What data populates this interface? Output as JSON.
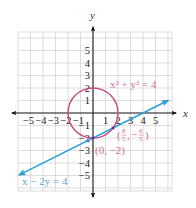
{
  "figure": {
    "axis_labels": {
      "x": "x",
      "y": "y"
    },
    "x_ticks": [
      "−5",
      "−4",
      "−3",
      "−2",
      "−1",
      "1",
      "2",
      "3",
      "4",
      "5"
    ],
    "y_ticks": [
      "5",
      "4",
      "3",
      "2",
      "1",
      "−1",
      "−2",
      "−3",
      "−4",
      "−5"
    ],
    "circle": {
      "equation": "x² + y² = 4",
      "center": [
        0,
        0
      ],
      "radius": 2,
      "color": "#c8507e"
    },
    "line": {
      "equation": "x − 2y = 4",
      "through": [
        [
          0,
          -2
        ],
        [
          4,
          0
        ]
      ],
      "color": "#2a9fd6"
    },
    "intersections": [
      {
        "label_open": "(",
        "num_x": "8",
        "den_x": "5",
        "sep": ",",
        "num_y": "6",
        "den_y": "5",
        "sign_y": "−",
        "label_close": ")",
        "point": [
          1.6,
          -1.2
        ]
      },
      {
        "label": "(0, −2)",
        "point": [
          0,
          -2
        ]
      }
    ],
    "grid": {
      "x_range": [
        -6,
        6
      ],
      "y_range": [
        -6,
        6
      ],
      "spacing": 1
    }
  }
}
